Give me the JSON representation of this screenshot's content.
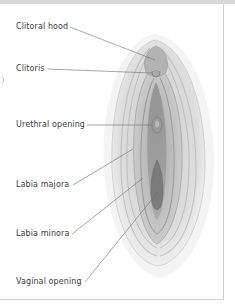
{
  "diagram": {
    "labels": [
      {
        "id": "clitoral-hood",
        "text": "Clitoral hood"
      },
      {
        "id": "clitoris",
        "text": "Clitoris"
      },
      {
        "id": "urethral-opening",
        "text": "Urethral  opening"
      },
      {
        "id": "labia-majora",
        "text": "Labia majora"
      },
      {
        "id": "labia-minora",
        "text": "Labia minora"
      },
      {
        "id": "vaginal-opening",
        "text": "Vaginal opening"
      }
    ],
    "colors": {
      "label_text": "#3a3a3a",
      "leader_line": "#6b6b6b",
      "frame_border": "#cfcfcf",
      "top_bar": "#d9d9d9"
    }
  }
}
